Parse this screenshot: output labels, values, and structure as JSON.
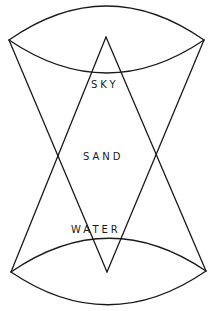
{
  "diagram": {
    "labels": {
      "top": "SKY",
      "middle": "SAND",
      "bottom": "WATER"
    },
    "colors": {
      "stroke": "#1a1a1a",
      "background": "#ffffff"
    },
    "shapes": {
      "top_lens": {
        "left": [
          9,
          40
        ],
        "right": [
          204,
          40
        ],
        "outer_peak_y": 6,
        "inner_low_y": 73
      },
      "bottom_lens": {
        "left": [
          11,
          272
        ],
        "right": [
          206,
          271
        ],
        "inner_peak_y": 238,
        "outer_low_y": 305
      },
      "upward_triangle_apex": [
        106,
        37
      ],
      "downward_triangle_apex": [
        107,
        272
      ],
      "side_crossings": [
        [
          57,
          157
        ],
        [
          157,
          157
        ]
      ]
    }
  }
}
